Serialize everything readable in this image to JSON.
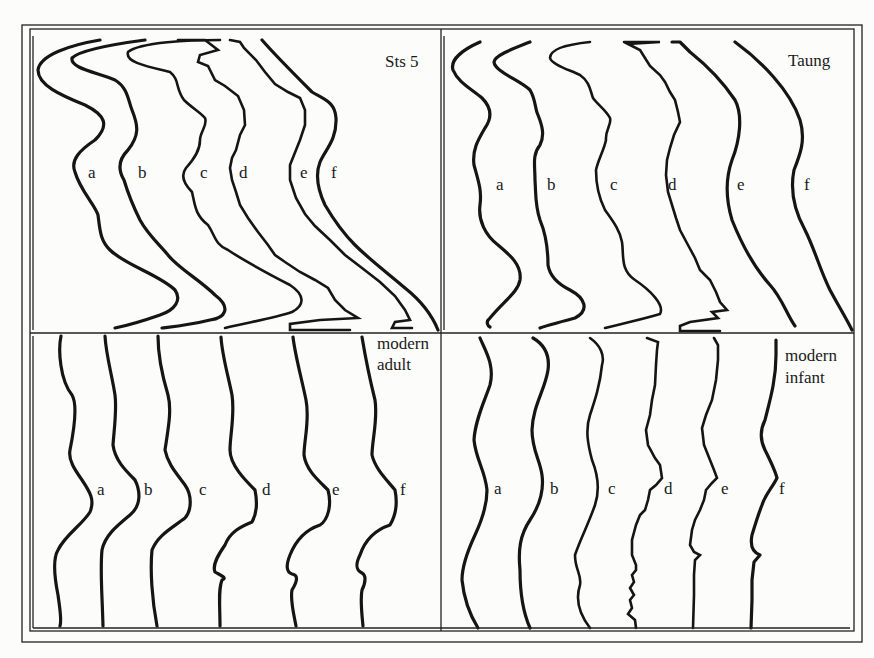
{
  "figure": {
    "panels": [
      {
        "id": "sts5",
        "title_lines": [
          "Sts 5"
        ],
        "curve_labels": [
          "a",
          "b",
          "c",
          "d",
          "e",
          "f"
        ]
      },
      {
        "id": "taung",
        "title_lines": [
          "Taung"
        ],
        "curve_labels": [
          "a",
          "b",
          "c",
          "d",
          "e",
          "f"
        ]
      },
      {
        "id": "modern-adult",
        "title_lines": [
          "modern",
          "adult"
        ],
        "curve_labels": [
          "a",
          "b",
          "c",
          "d",
          "e",
          "f"
        ]
      },
      {
        "id": "modern-infant",
        "title_lines": [
          "modern",
          "infant"
        ],
        "curve_labels": [
          "a",
          "b",
          "c",
          "d",
          "e",
          "f"
        ]
      }
    ],
    "ink_color": "#151515",
    "paper_color": "#fcfcfa"
  }
}
